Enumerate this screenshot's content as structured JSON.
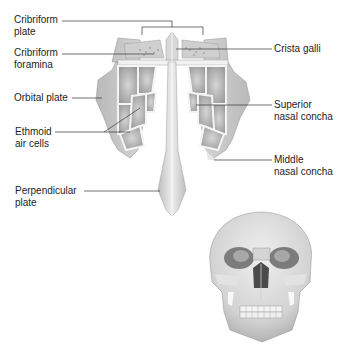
{
  "diagram": {
    "labels": {
      "cribriform_plate": [
        "Cribriform",
        "plate"
      ],
      "cribriform_foramina": [
        "Cribriform",
        "foramina"
      ],
      "orbital_plate": [
        "Orbital plate"
      ],
      "ethmoid_air_cells": [
        "Ethmoid",
        "air cells"
      ],
      "perpendicular_plate": [
        "Perpendicular",
        "plate"
      ],
      "crista_galli": [
        "Crista galli"
      ],
      "superior_nasal_concha": [
        "Superior",
        "nasal concha"
      ],
      "middle_nasal_concha": [
        "Middle",
        "nasal concha"
      ]
    },
    "colors": {
      "bone_light": "#e6e6e6",
      "bone_mid": "#c8c8c8",
      "bone_dark": "#8e8e8e",
      "leader_line": "#333333",
      "text": "#1e1e1e",
      "background": "#ffffff"
    }
  }
}
